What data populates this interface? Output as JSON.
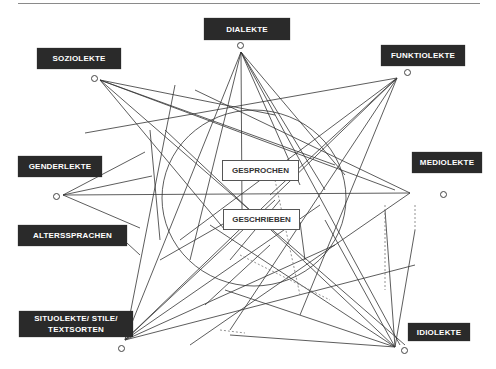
{
  "diagram": {
    "outer_labels": {
      "dialekte": "DIALEKTE",
      "soziolekte": "SOZIOLEKTE",
      "funktiolekte": "FUNKTIOLEKTE",
      "genderlekte": "GENDERLEKTE",
      "mediolekte": "MEDIOLEKTE",
      "alterssprachen": "ALTERSSPRACHEN",
      "situolekte": "SITUOLEKTE/ STILE/ TEXTSORTEN",
      "idiolekte": "IDIOLEKTE"
    },
    "inner_labels": {
      "gesprochen": "GESPROCHEN",
      "geschrieben": "GESCHRIEBEN"
    },
    "colors": {
      "label_bg": "#2a2a2a",
      "label_text": "#ffffff",
      "line": "#333333"
    }
  }
}
